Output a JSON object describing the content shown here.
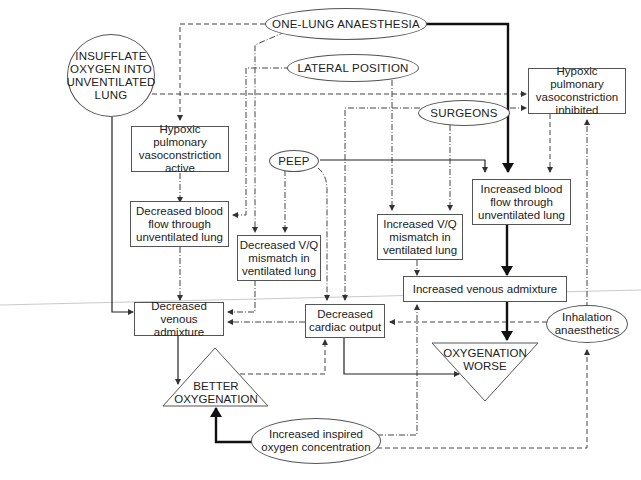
{
  "diagram": {
    "nodes": {
      "one_lung": "ONE-LUNG ANAESTHESIA",
      "insufflate": "INSUFFLATE OXYGEN INTO UNVENTILATED LUNG",
      "lateral": "LATERAL POSITION",
      "hpv_inhibited": "Hypoxic pulmonary vasoconstriction inhibited",
      "surgeons": "SURGEONS",
      "hpv_active": "Hypoxic pulmonary vasoconstriction active",
      "peep": "PEEP",
      "inc_blood_flow": "Increased blood flow through unventilated lung",
      "dec_blood_flow": "Decreased blood flow through unventilated lung",
      "dec_vq": "Decreased V/Q mismatch in ventilated lung",
      "inc_vq": "Increased V/Q mismatch in ventilated lung",
      "inc_venous": "Increased venous admixture",
      "dec_venous": "Decreased venous admixture",
      "dec_cardiac": "Decreased cardiac output",
      "inhalation": "Inhalation anaesthetics",
      "better_oxy": "BETTER OXYGENATION",
      "oxy_worse": "OXYGENATION WORSE",
      "inc_inspired": "Increased inspired oxygen concentration"
    },
    "edges": [
      {
        "from": "one_lung",
        "to": "inc_blood_flow",
        "style": "thick-solid"
      },
      {
        "from": "one_lung",
        "to": "hpv_active",
        "style": "dashed"
      },
      {
        "from": "one_lung",
        "to": "dec_vq",
        "style": "dash-dot"
      },
      {
        "from": "lateral",
        "to": "dec_blood_flow",
        "style": "dash-dot"
      },
      {
        "from": "lateral",
        "to": "inc_vq",
        "style": "dash-dot"
      },
      {
        "from": "insufflate",
        "to": "hpv_inhibited",
        "style": "dashed"
      },
      {
        "from": "insufflate",
        "to": "dec_venous",
        "style": "solid"
      },
      {
        "from": "surgeons",
        "to": "hpv_inhibited",
        "style": "dash-dot"
      },
      {
        "from": "surgeons",
        "to": "dec_cardiac",
        "style": "dash-dot"
      },
      {
        "from": "surgeons",
        "to": "inc_vq",
        "style": "dash-dot"
      },
      {
        "from": "hpv_inhibited",
        "to": "inc_blood_flow",
        "style": "dashed"
      },
      {
        "from": "hpv_active",
        "to": "dec_blood_flow",
        "style": "dash-dot"
      },
      {
        "from": "dec_blood_flow",
        "to": "dec_venous",
        "style": "dash-dot"
      },
      {
        "from": "peep",
        "to": "inc_blood_flow",
        "style": "solid"
      },
      {
        "from": "peep",
        "to": "dec_vq",
        "style": "dash-dot"
      },
      {
        "from": "peep",
        "to": "dec_cardiac",
        "style": "dash-dot"
      },
      {
        "from": "dec_vq",
        "to": "dec_venous",
        "style": "dash-dot"
      },
      {
        "from": "inc_vq",
        "to": "inc_venous",
        "style": "dash-dot"
      },
      {
        "from": "inc_blood_flow",
        "to": "inc_venous",
        "style": "thick-solid"
      },
      {
        "from": "inc_venous",
        "to": "oxy_worse",
        "style": "thick-solid"
      },
      {
        "from": "dec_cardiac",
        "to": "dec_venous",
        "style": "dash-dot"
      },
      {
        "from": "dec_cardiac",
        "to": "oxy_worse",
        "style": "solid"
      },
      {
        "from": "inhalation",
        "to": "dec_cardiac",
        "style": "dashed"
      },
      {
        "from": "inhalation",
        "to": "hpv_inhibited",
        "style": "dash-dot"
      },
      {
        "from": "dec_venous",
        "to": "better_oxy",
        "style": "solid"
      },
      {
        "from": "better_oxy",
        "to": "dec_cardiac",
        "style": "dashed"
      },
      {
        "from": "inc_inspired",
        "to": "better_oxy",
        "style": "thick-solid"
      },
      {
        "from": "inc_inspired",
        "to": "inc_venous",
        "style": "dash-dot"
      },
      {
        "from": "inc_inspired",
        "to": "inhalation",
        "style": "dashed"
      }
    ]
  }
}
